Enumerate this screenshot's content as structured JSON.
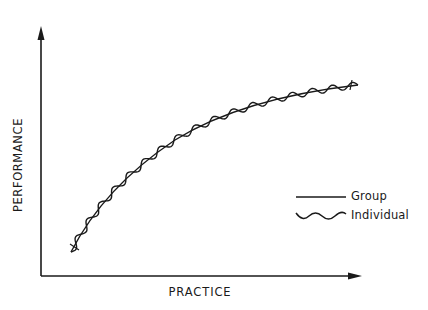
{
  "figure": {
    "y_axis_label": "PERFORMANCE",
    "x_axis_label": "PRACTICE",
    "legend": [
      {
        "label": "Group",
        "style": "solid-line",
        "icon": "straight-line-icon"
      },
      {
        "label": "Individual",
        "style": "wavy-line",
        "icon": "wavy-line-icon"
      }
    ],
    "line_color": "#1a1a1a",
    "background": "#ffffff"
  },
  "chart_data": {
    "type": "line",
    "title": "",
    "xlabel": "PRACTICE",
    "ylabel": "PERFORMANCE",
    "grid": false,
    "ticks": false,
    "legend_position": "right-middle",
    "x_range": [
      0,
      1
    ],
    "y_range": [
      0,
      1
    ],
    "series": [
      {
        "name": "Group",
        "style": "smooth solid curve (negatively accelerated learning curve)",
        "x": [
          0.09,
          0.15,
          0.22,
          0.28,
          0.34,
          0.41,
          0.5,
          0.59,
          0.69,
          0.78,
          0.88,
          1.0
        ],
        "values": [
          0.1,
          0.24,
          0.34,
          0.42,
          0.49,
          0.55,
          0.61,
          0.66,
          0.7,
          0.73,
          0.75,
          0.77
        ]
      },
      {
        "name": "Individual",
        "style": "wavy curve oscillating around the Group curve",
        "x": [
          0.09,
          0.15,
          0.22,
          0.28,
          0.34,
          0.41,
          0.5,
          0.59,
          0.69,
          0.78,
          0.88,
          1.0
        ],
        "values": [
          0.1,
          0.24,
          0.34,
          0.42,
          0.49,
          0.55,
          0.61,
          0.66,
          0.7,
          0.73,
          0.75,
          0.77
        ]
      }
    ]
  }
}
